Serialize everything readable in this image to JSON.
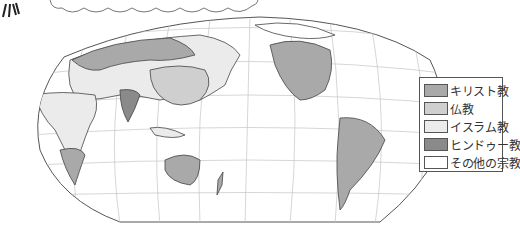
{
  "map": {
    "title": "",
    "projection": "world-map-pacific-centered",
    "colors": {
      "christianity": "#a9a9a9",
      "buddhism": "#cfcfcf",
      "islam": "#ebebeb",
      "hinduism": "#8a8a8a",
      "other": "#ffffff",
      "outline": "#444444",
      "grid": "#bdbdbd"
    }
  },
  "legend": {
    "items": [
      {
        "label": "キリスト教",
        "color": "#a9a9a9",
        "icon": "christianity-swatch"
      },
      {
        "label": "仏教",
        "color": "#cfcfcf",
        "icon": "buddhism-swatch"
      },
      {
        "label": "イスラム教",
        "color": "#ebebeb",
        "icon": "islam-swatch"
      },
      {
        "label": "ヒンドゥー教",
        "color": "#8a8a8a",
        "icon": "hinduism-swatch"
      },
      {
        "label": "その他の宗教",
        "color": "#ffffff",
        "icon": "other-religion-swatch"
      }
    ]
  }
}
